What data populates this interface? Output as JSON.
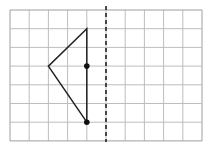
{
  "diagram": {
    "type": "grid-reflection",
    "grid": {
      "columns": 10,
      "rows": 7,
      "origin_px": [
        10,
        10
      ],
      "cell_w": 19.2,
      "cell_h": 18.7,
      "line_color": "#bdbdbd",
      "border_color": "#9e9e9e"
    },
    "mirror_line": {
      "column": 5,
      "style": "dashed",
      "color": "#222222"
    },
    "shape": {
      "name": "triangle",
      "vertices_grid": [
        [
          4,
          1
        ],
        [
          2,
          3
        ],
        [
          4,
          6
        ]
      ],
      "stroke": "#222222"
    },
    "points_grid": [
      [
        4,
        3
      ],
      [
        4,
        6
      ]
    ],
    "point_color": "#111111"
  }
}
